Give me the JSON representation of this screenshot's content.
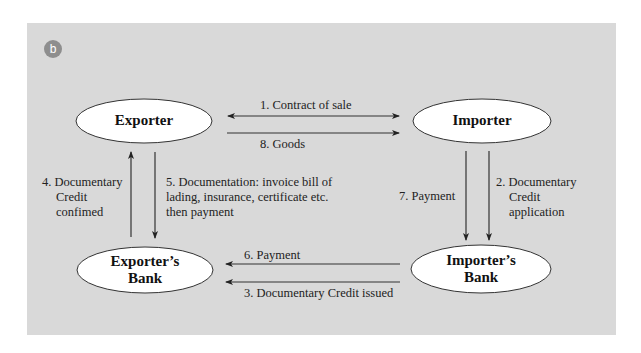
{
  "figure": {
    "panel_label": "b",
    "colors": {
      "panel_bg": "#d9d9d9",
      "badge_bg": "#8e8e8e",
      "node_fill": "#ffffff",
      "stroke": "#333333"
    }
  },
  "nodes": {
    "exporter": "Exporter",
    "importer": "Importer",
    "exporters_bank_line1": "Exporter’s",
    "exporters_bank_line2": "Bank",
    "importers_bank_line1": "Importer’s",
    "importers_bank_line2": "Bank"
  },
  "flows": [
    {
      "step": 1,
      "label": "1. Contract of sale",
      "from": "Exporter",
      "to": "Importer",
      "bidirectional": true
    },
    {
      "step": 2,
      "label_lines": [
        "2. Documentary",
        "Credit",
        "application"
      ],
      "from": "Importer",
      "to": "Importer's Bank"
    },
    {
      "step": 3,
      "label": "3. Documentary Credit issued",
      "from": "Importer's Bank",
      "to": "Exporter's Bank"
    },
    {
      "step": 4,
      "label_lines": [
        "4. Documentary",
        "Credit",
        "confimed"
      ],
      "from": "Exporter's Bank",
      "to": "Exporter"
    },
    {
      "step": 5,
      "label_lines": [
        "5. Documentation: invoice bill of",
        "lading, insurance, certificate etc.",
        "then payment"
      ],
      "from": "Exporter",
      "to": "Exporter's Bank"
    },
    {
      "step": 6,
      "label": "6. Payment",
      "from": "Importer's Bank",
      "to": "Exporter's Bank"
    },
    {
      "step": 7,
      "label": "7. Payment",
      "from": "Importer",
      "to": "Importer's Bank"
    },
    {
      "step": 8,
      "label": "8. Goods",
      "from": "Exporter",
      "to": "Importer"
    }
  ]
}
